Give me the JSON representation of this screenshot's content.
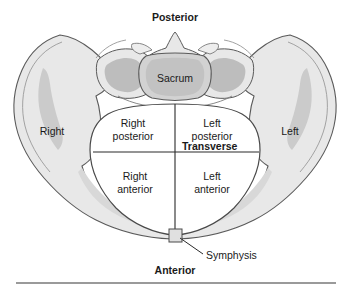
{
  "figure": {
    "title_alt": "Transverse section of the female bony pelvis showing pelvic inlet quadrants",
    "colors": {
      "bone_fill": "#e8e8e8",
      "bone_shade": "#c9c9c9",
      "bone_shade_dark": "#bdbdbd",
      "sacrum_fill": "#d0d0d0",
      "inlet_fill": "#ffffff",
      "outline": "#4a4a4a",
      "text": "#1a1a1a",
      "rule": "#9a9a9a"
    },
    "orientation_labels": {
      "posterior": "Posterior",
      "anterior": "Anterior",
      "right": "Right",
      "left": "Left"
    },
    "structures": {
      "sacrum": "Sacrum",
      "symphysis": "Symphysis"
    },
    "axis_label": "Transverse",
    "quadrants": [
      {
        "id": "right-posterior",
        "line1": "Right",
        "line2": "posterior"
      },
      {
        "id": "left-posterior",
        "line1": "Left",
        "line2": "posterior"
      },
      {
        "id": "right-anterior",
        "line1": "Right",
        "line2": "anterior"
      },
      {
        "id": "left-anterior",
        "line1": "Left",
        "line2": "anterior"
      }
    ]
  }
}
